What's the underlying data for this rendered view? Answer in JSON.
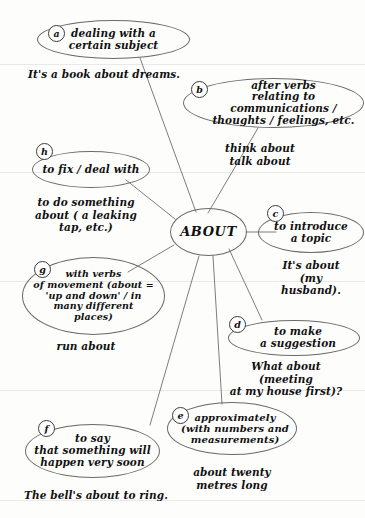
{
  "diagram": {
    "title": "ABOUT",
    "center": {
      "label": "ABOUT"
    },
    "ink_color": "#6a6a6a",
    "text_color": "#111111",
    "paper_color": "#fdfdfc",
    "nodes": [
      {
        "key": "a",
        "badge": "a",
        "label": "dealing with a\ncertain subject",
        "font_size": 10.5
      },
      {
        "key": "b",
        "badge": "b",
        "label": "after verbs\nrelating to communications /\nthoughts / feelings, etc.",
        "font_size": 10.5
      },
      {
        "key": "c",
        "badge": "c",
        "label": "to introduce\na topic",
        "font_size": 10.5
      },
      {
        "key": "d",
        "badge": "d",
        "label": "to make\na suggestion",
        "font_size": 10.5
      },
      {
        "key": "e",
        "badge": "e",
        "label": "approximately\n(with numbers and\nmeasurements)",
        "font_size": 10
      },
      {
        "key": "f",
        "badge": "f",
        "label": "to say\nthat something will\nhappen very soon",
        "font_size": 10.5
      },
      {
        "key": "g",
        "badge": "g",
        "label": "with verbs\nof movement (about =\n'up and down' / in\nmany different\nplaces)",
        "font_size": 9.5
      },
      {
        "key": "h",
        "badge": "h",
        "label": "to fix / deal with",
        "font_size": 10.5
      }
    ],
    "examples": [
      {
        "key": "ex_a",
        "text": "It's a book about dreams.",
        "font_size": 10.5
      },
      {
        "key": "ex_b",
        "text": "think about\ntalk about",
        "font_size": 10.5
      },
      {
        "key": "ex_c",
        "text": "It's about\n(my husband).",
        "font_size": 10.5
      },
      {
        "key": "ex_d",
        "text": "What about (meeting\nat my house first)?",
        "font_size": 10.5
      },
      {
        "key": "ex_e",
        "text": "about twenty\nmetres long",
        "font_size": 10.5
      },
      {
        "key": "ex_f",
        "text": "The bell's about to ring.",
        "font_size": 10.5
      },
      {
        "key": "ex_g",
        "text": "run about",
        "font_size": 10.5
      },
      {
        "key": "ex_h",
        "text": "to do something\nabout ( a leaking\ntap, etc.)",
        "font_size": 10.5
      }
    ]
  }
}
